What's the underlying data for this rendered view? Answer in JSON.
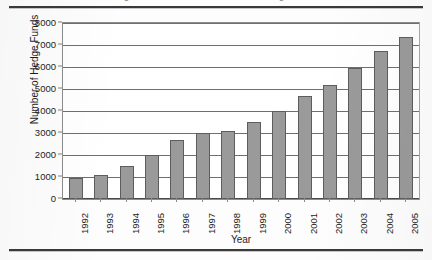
{
  "document": {
    "clipped_running_head": "Figure 1. Growth in the number of hedge funds"
  },
  "chart_data": {
    "type": "bar",
    "title": "",
    "xlabel": "Year",
    "ylabel": "Number of Hedge Funds",
    "categories": [
      "1992",
      "1993",
      "1994",
      "1995",
      "1996",
      "1997",
      "1998",
      "1999",
      "2000",
      "2001",
      "2002",
      "2003",
      "2004",
      "2005"
    ],
    "values": [
      950,
      1100,
      1500,
      2000,
      2700,
      3000,
      3100,
      3500,
      4000,
      4700,
      5200,
      5950,
      6750,
      7350
    ],
    "series": [
      {
        "name": "Number of Hedge Funds",
        "values": [
          950,
          1100,
          1500,
          2000,
          2700,
          3000,
          3100,
          3500,
          4000,
          4700,
          5200,
          5950,
          6750,
          7350
        ]
      }
    ],
    "ylim": [
      0,
      8000
    ],
    "y_ticks": [
      0,
      1000,
      2000,
      3000,
      4000,
      5000,
      6000,
      7000,
      8000
    ],
    "y_tick_labels": [
      "0",
      "1000",
      "2000",
      "3000",
      "4000",
      "5000",
      "6000",
      "7000",
      "8000"
    ],
    "grid": true,
    "grid_axis": "y",
    "legend": false,
    "legend_position": "none",
    "bar_color": "#9a9a9a",
    "bar_edge_color": "#5d5d5d",
    "grid_color": "#6f6f6f",
    "plot_border_color": "#8c8c8c",
    "background_color": "#ffffff",
    "text_color": "#1c1c1c",
    "x_tick_rotation": 90
  }
}
